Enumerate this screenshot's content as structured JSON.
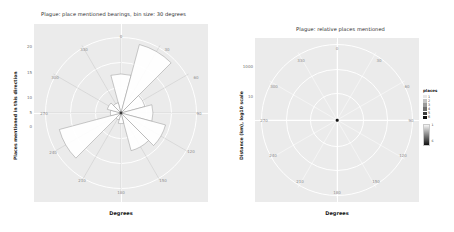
{
  "figure": {
    "background": "#ffffff",
    "panel_background": "#ebebeb",
    "gridline_color": "#ffffff"
  },
  "left_panel": {
    "title": "Plague: place mentioned bearings, bin size: 30 degrees",
    "xlabel": "Degrees",
    "ylabel": "Places mentioned in this direction",
    "yticks": [
      "20",
      "15",
      "10",
      "5",
      "0"
    ],
    "degree_labels": [
      "0",
      "30",
      "60",
      "90",
      "120",
      "150",
      "180",
      "210",
      "240",
      "270",
      "300",
      "330"
    ]
  },
  "right_panel": {
    "title": "Plague: relative places mentioned",
    "xlabel": "Degrees",
    "ylabel": "Distance (km), log10 scale",
    "yticks": [
      "1000",
      "10"
    ],
    "degree_labels": [
      "0",
      "30",
      "60",
      "90",
      "120",
      "150",
      "180",
      "210",
      "240",
      "270",
      "300",
      "330"
    ],
    "legend": {
      "title": "places",
      "entries": [
        {
          "label": "1",
          "color": "#e8e8e8"
        },
        {
          "label": "2",
          "color": "#c4c4c4"
        },
        {
          "label": "3",
          "color": "#9a9a9a"
        },
        {
          "label": "4",
          "color": "#6e6e6e"
        },
        {
          "label": "5",
          "color": "#3c3c3c"
        },
        {
          "label": "6",
          "color": "#111111"
        }
      ],
      "gradient": {
        "title": "count",
        "max_label": "1",
        "min_label": "6"
      }
    }
  },
  "chart_data": [
    {
      "type": "bar",
      "subtype": "polar-rose-histogram",
      "title": "Plague: place mentioned bearings, bin size: 30 degrees",
      "xlabel": "Degrees",
      "ylabel": "Places mentioned in this direction",
      "bin_size_degrees": 30,
      "categories": [
        "0",
        "30",
        "60",
        "90",
        "120",
        "150",
        "180",
        "210",
        "240",
        "270",
        "300",
        "330"
      ],
      "values": [
        11,
        20,
        7,
        9,
        13,
        11,
        3,
        2,
        18,
        3,
        4,
        3
      ],
      "ylim": [
        0,
        22
      ],
      "yticks": [
        0,
        5,
        10,
        15,
        20
      ],
      "grid": true,
      "legend": "none"
    },
    {
      "type": "scatter",
      "subtype": "polar-scatter",
      "title": "Plague: relative places mentioned",
      "xlabel": "Degrees",
      "ylabel": "Distance (km), log10 scale",
      "theta_ticks": [
        0,
        30,
        60,
        90,
        120,
        150,
        180,
        210,
        240,
        270,
        300,
        330
      ],
      "r_scale": "log10",
      "r_ticks": [
        10,
        1000
      ],
      "points": [
        {
          "theta": 0,
          "r": 1,
          "count": 6
        }
      ],
      "grid": true,
      "legend_position": "right",
      "legend_title": "places"
    }
  ]
}
